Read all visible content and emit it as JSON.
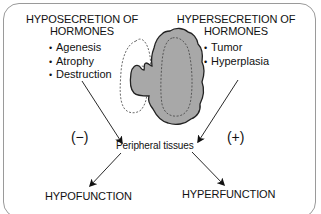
{
  "diagram": {
    "left_panel": {
      "heading_line1": "HYPOSECRETION OF",
      "heading_line2": "HORMONES",
      "bullets": [
        "Agenesis",
        "Atrophy",
        "Destruction"
      ],
      "effect_sign": "(−)"
    },
    "right_panel": {
      "heading_line1": "HYPERSECRETION OF",
      "heading_line2": "HORMONES",
      "bullets": [
        "Tumor",
        "Hyperplasia"
      ],
      "effect_sign": "(+)"
    },
    "center": {
      "target_label": "Peripheral tissues",
      "gland_fill_color": "#a8a8a8",
      "gland_stroke_color": "#222222",
      "atrophic_outline_style": "dashed"
    },
    "outcomes": {
      "left": "HYPOFUNCTION",
      "right": "HYPERFUNCTION"
    },
    "colors": {
      "frame_border": "#9a9a9a",
      "text": "#111111",
      "arrow": "#111111"
    }
  }
}
